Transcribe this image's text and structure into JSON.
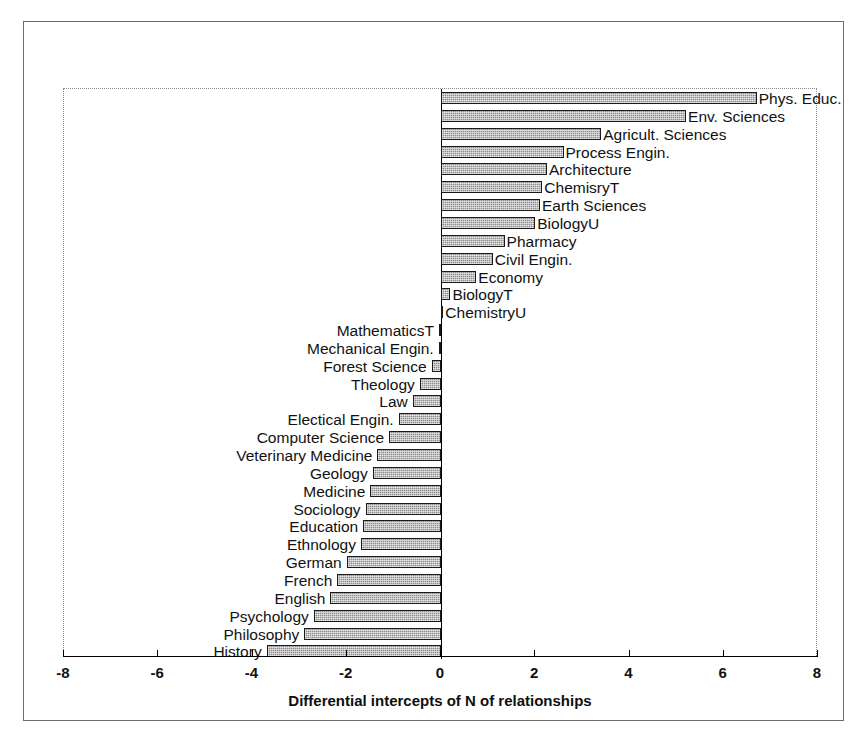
{
  "figure": {
    "background_color": "#ffffff",
    "frame_color": "#6c6c6c",
    "bar_fill_color": "#8c8c8c",
    "bar_border_color": "#1a1a1a"
  },
  "axis": {
    "title": "Differential intercepts of N of relationships",
    "tick_labels": [
      "-8",
      "-6",
      "-4",
      "-2",
      "0",
      "2",
      "4",
      "6",
      "8"
    ],
    "tick_values": [
      -8,
      -6,
      -4,
      -2,
      0,
      2,
      4,
      6,
      8
    ],
    "min": -8,
    "max": 8
  },
  "chart_data": {
    "type": "bar",
    "orientation": "horizontal",
    "title": "",
    "subtitle": "",
    "xlabel": "Differential intercepts of N of relationships",
    "ylabel": "",
    "xlim": [
      -8,
      8
    ],
    "xticks": [
      -8,
      -6,
      -4,
      -2,
      0,
      2,
      4,
      6,
      8
    ],
    "grid": false,
    "legend": "none",
    "categories": [
      "Phys. Educ.",
      "Env. Sciences",
      "Agricult. Sciences",
      "Process Engin.",
      "Architecture",
      "ChemisryT",
      "Earth Sciences",
      "BiologyU",
      "Pharmacy",
      "Civil Engin.",
      "Economy",
      "BiologyT",
      "ChemistryU",
      "MathematicsT",
      "Mechanical Engin.",
      "Forest Science",
      "Theology",
      "Law",
      "Electical Engin.",
      "Computer Science",
      "Veterinary Medicine",
      "Geology",
      "Medicine",
      "Sociology",
      "Education",
      "Ethnology",
      "German",
      "French",
      "English",
      "Psychology",
      "Philosophy",
      "History"
    ],
    "values": [
      6.7,
      5.2,
      3.4,
      2.6,
      2.25,
      2.15,
      2.1,
      2.0,
      1.35,
      1.1,
      0.75,
      0.2,
      0.05,
      -0.03,
      -0.05,
      -0.2,
      -0.45,
      -0.6,
      -0.9,
      -1.1,
      -1.35,
      -1.45,
      -1.5,
      -1.6,
      -1.65,
      -1.7,
      -2.0,
      -2.2,
      -2.35,
      -2.7,
      -2.9,
      -3.7
    ]
  }
}
